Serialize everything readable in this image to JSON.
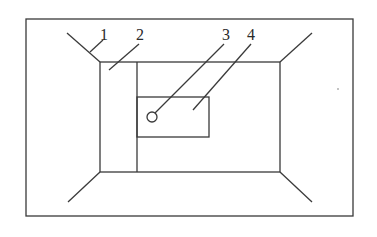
{
  "diagram": {
    "type": "perspective room schematic with labeled parts",
    "colors": {
      "stroke": "#3a3a3a",
      "text": "#2a2a2a",
      "background": "#ffffff"
    },
    "labels": [
      {
        "id": "1",
        "text": "1"
      },
      {
        "id": "2",
        "text": "2"
      },
      {
        "id": "3",
        "text": "3"
      },
      {
        "id": "4",
        "text": "4"
      }
    ]
  }
}
